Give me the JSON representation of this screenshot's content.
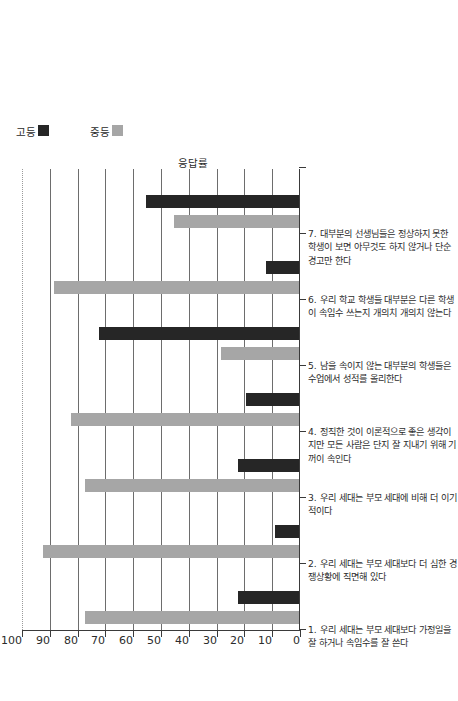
{
  "chart_data": {
    "type": "bar",
    "title": "",
    "xlabel": "",
    "ylabel": "응답률",
    "ylim": [
      0,
      100
    ],
    "yticks": [
      0,
      10,
      20,
      30,
      40,
      50,
      60,
      70,
      80,
      90,
      100
    ],
    "grid": true,
    "legend_position": "right",
    "orientation": "rotated-90",
    "categories": [
      "1. 우리 세대는 부모 세대보다 가정일을 잘 하거나 속임수를 잘 쓴다",
      "2. 우리 세대는 부모 세대보다 더 심한 경쟁상황에 직면해 있다",
      "3. 우리 세대는 부모 세대에 비해 더 이기적이다",
      "4. 정직한 것이 이론적으로 좋은 생각이지만 모든 사람은 단지 잘 지내기 위해 기꺼이 속인다",
      "5. 남을 속이지 않는 대부분의 학생들은 수업에서 성적를 올리한다",
      "6. 우리 학교 학생들 대부분은 다른 학생이 속임수 쓰는지 개의치 개의치 않는다",
      "7. 대부분의 선생님들은 정상하지 못한 학생이 보면 아무것도 하지 않거나 단순 경고만 한다"
    ],
    "series": [
      {
        "name": "중등",
        "color": "#a6a6a6",
        "values": [
          77,
          92,
          77,
          82,
          28,
          88,
          45
        ]
      },
      {
        "name": "고등",
        "color": "#262626",
        "values": [
          22,
          8.5,
          22,
          19,
          72,
          12,
          55
        ]
      }
    ]
  },
  "legend": {
    "items": [
      {
        "label": "고등",
        "color": "#262626"
      },
      {
        "label": "중등",
        "color": "#a6a6a6"
      }
    ]
  },
  "axis": {
    "y_title": "응답률"
  }
}
